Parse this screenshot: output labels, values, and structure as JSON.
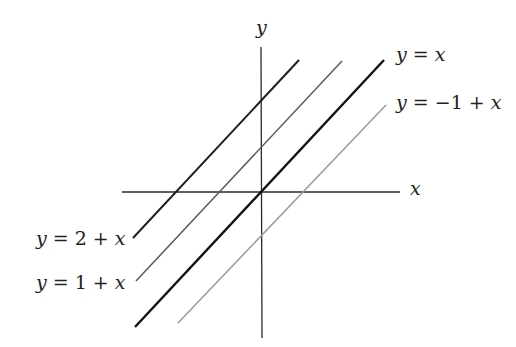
{
  "diagram": {
    "title": "",
    "axes": {
      "x_label": "x",
      "y_label": "y",
      "color": "#2a2a2a"
    },
    "lines": [
      {
        "id": "line-y-2-plus-x",
        "equation": "y = 2 + x",
        "label_parts": [
          "y",
          " = 2 + ",
          "x"
        ],
        "intercept": 2,
        "slope": 1,
        "color": "#1e1e1e",
        "label_position": "left"
      },
      {
        "id": "line-y-1-plus-x",
        "equation": "y = 1 + x",
        "label_parts": [
          "y",
          " = 1 + ",
          "x"
        ],
        "intercept": 1,
        "slope": 1,
        "color": "#555555",
        "label_position": "left"
      },
      {
        "id": "line-y-x",
        "equation": "y = x",
        "label_parts": [
          "y",
          " = ",
          "x"
        ],
        "intercept": 0,
        "slope": 1,
        "color": "#111111",
        "label_position": "right"
      },
      {
        "id": "line-y-minus-1-plus-x",
        "equation": "y = −1 + x",
        "label_parts": [
          "y",
          " = −1 + ",
          "x"
        ],
        "intercept": -1,
        "slope": 1,
        "color": "#9a9a9a",
        "label_position": "right"
      }
    ]
  }
}
